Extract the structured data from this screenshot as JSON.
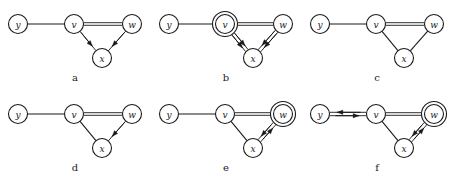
{
  "figure": {
    "node_labels": [
      "y",
      "v",
      "w",
      "x"
    ],
    "colors": {
      "ink": "#1a1a1a",
      "background": "#ffffff"
    },
    "node_positions": {
      "y": [
        18,
        24
      ],
      "v": [
        74,
        24
      ],
      "w": [
        132,
        24
      ],
      "x": [
        102,
        58
      ]
    },
    "node_radius": 9.5,
    "double_ring_radius": 12.5,
    "panels": [
      {
        "id": "a",
        "caption": "a",
        "marked_node": null,
        "edges": [
          {
            "from": "y",
            "to": "v",
            "style": "single",
            "arrows": "none"
          },
          {
            "from": "v",
            "to": "w",
            "style": "double",
            "arrows": "none"
          },
          {
            "from": "v",
            "to": "x",
            "style": "single",
            "arrows": "forward"
          },
          {
            "from": "w",
            "to": "x",
            "style": "single",
            "arrows": "forward"
          }
        ]
      },
      {
        "id": "b",
        "caption": "b",
        "marked_node": "v",
        "edges": [
          {
            "from": "y",
            "to": "v",
            "style": "single",
            "arrows": "none"
          },
          {
            "from": "v",
            "to": "w",
            "style": "double",
            "arrows": "none"
          },
          {
            "from": "v",
            "to": "x",
            "style": "double",
            "arrows": "forward"
          },
          {
            "from": "w",
            "to": "x",
            "style": "double",
            "arrows": "forward"
          }
        ]
      },
      {
        "id": "c",
        "caption": "c",
        "marked_node": null,
        "edges": [
          {
            "from": "y",
            "to": "v",
            "style": "single",
            "arrows": "none"
          },
          {
            "from": "v",
            "to": "w",
            "style": "double",
            "arrows": "none"
          },
          {
            "from": "v",
            "to": "x",
            "style": "single",
            "arrows": "none"
          },
          {
            "from": "w",
            "to": "x",
            "style": "single",
            "arrows": "none"
          }
        ]
      },
      {
        "id": "d",
        "caption": "d",
        "marked_node": null,
        "edges": [
          {
            "from": "y",
            "to": "v",
            "style": "single",
            "arrows": "none"
          },
          {
            "from": "v",
            "to": "w",
            "style": "double",
            "arrows": "none"
          },
          {
            "from": "v",
            "to": "x",
            "style": "single",
            "arrows": "none"
          },
          {
            "from": "w",
            "to": "x",
            "style": "single",
            "arrows": "forward"
          }
        ]
      },
      {
        "id": "e",
        "caption": "e",
        "marked_node": "w",
        "edges": [
          {
            "from": "y",
            "to": "v",
            "style": "single",
            "arrows": "none"
          },
          {
            "from": "v",
            "to": "w",
            "style": "double",
            "arrows": "none"
          },
          {
            "from": "v",
            "to": "x",
            "style": "single",
            "arrows": "none"
          },
          {
            "from": "w",
            "to": "x",
            "style": "double",
            "arrows": "both"
          }
        ]
      },
      {
        "id": "f",
        "caption": "f",
        "marked_node": "w",
        "edges": [
          {
            "from": "y",
            "to": "v",
            "style": "double",
            "arrows": "both"
          },
          {
            "from": "v",
            "to": "w",
            "style": "double",
            "arrows": "none"
          },
          {
            "from": "v",
            "to": "x",
            "style": "single",
            "arrows": "none"
          },
          {
            "from": "w",
            "to": "x",
            "style": "double",
            "arrows": "both"
          }
        ]
      }
    ]
  }
}
